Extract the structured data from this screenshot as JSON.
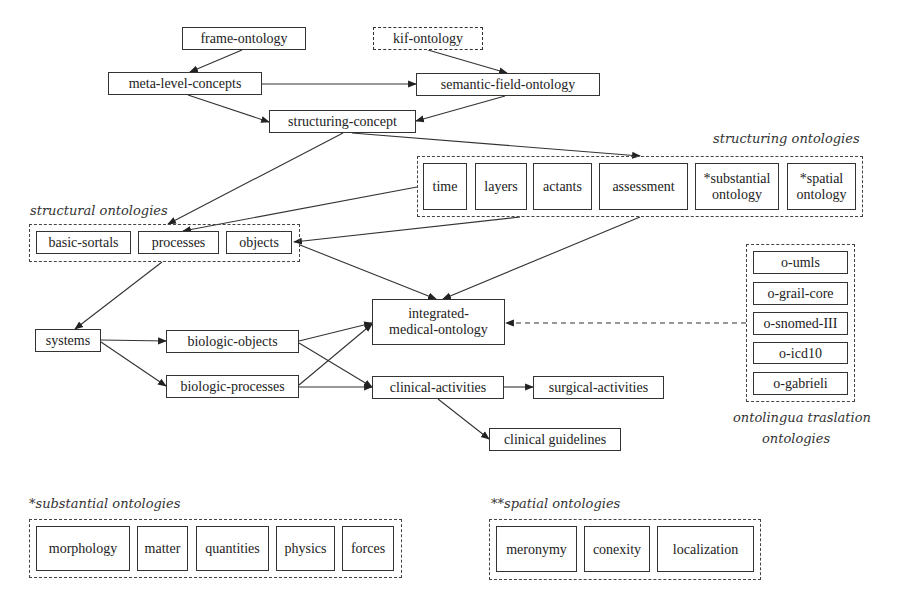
{
  "diagram": {
    "nodes": {
      "frame_ontology": "frame-ontology",
      "kif_ontology": "kif-ontology",
      "meta_level_concepts": "meta-level-concepts",
      "semantic_field_ontology": "semantic-field-ontology",
      "structuring_concept": "structuring-concept",
      "integrated_medical_ontology": "integrated-medical-ontology",
      "systems": "systems",
      "biologic_objects": "biologic-objects",
      "biologic_processes": "biologic-processes",
      "clinical_activities": "clinical-activities",
      "surgical_activities": "surgical-activities",
      "clinical_guidelines": "clinical guidelines"
    },
    "integrated_lines": [
      "integrated-",
      "medical-ontology"
    ],
    "groups": {
      "structuring": {
        "label": "structuring ontologies",
        "items": [
          {
            "lines": [
              "time"
            ]
          },
          {
            "lines": [
              "layers"
            ]
          },
          {
            "lines": [
              "actants"
            ]
          },
          {
            "lines": [
              "assessment"
            ]
          },
          {
            "lines": [
              "*substantial",
              "ontology"
            ]
          },
          {
            "lines": [
              "*spatial",
              "ontology"
            ]
          }
        ]
      },
      "structural": {
        "label": "structural ontologies",
        "items": [
          "basic-sortals",
          "processes",
          "objects"
        ]
      },
      "ontolingua": {
        "label_line1": "ontolingua traslation",
        "label_line2": "ontologies",
        "items": [
          "o-umls",
          "o-grail-core",
          "o-snomed-III",
          "o-icd10",
          "o-gabrieli"
        ]
      },
      "substantial": {
        "label": "*substantial ontologies",
        "items": [
          "morphology",
          "matter",
          "quantities",
          "physics",
          "forces"
        ]
      },
      "spatial": {
        "label": "**spatial ontologies",
        "items": [
          "meronymy",
          "conexity",
          "localization"
        ]
      }
    },
    "edges": [
      {
        "from": "frame-ontology",
        "to": "meta-level-concepts",
        "style": "solid"
      },
      {
        "from": "kif-ontology",
        "to": "semantic-field-ontology",
        "style": "solid"
      },
      {
        "from": "meta-level-concepts",
        "to": "semantic-field-ontology",
        "style": "solid"
      },
      {
        "from": "meta-level-concepts",
        "to": "structuring-concept",
        "style": "solid"
      },
      {
        "from": "semantic-field-ontology",
        "to": "structuring-concept",
        "style": "solid"
      },
      {
        "from": "structuring-concept",
        "to": "structuring ontologies",
        "style": "solid"
      },
      {
        "from": "structuring-concept",
        "to": "structural ontologies",
        "style": "solid"
      },
      {
        "from": "time",
        "to": "processes",
        "style": "solid"
      },
      {
        "from": "structuring ontologies",
        "to": "objects",
        "style": "solid"
      },
      {
        "from": "objects",
        "to": "integrated-medical-ontology",
        "style": "solid"
      },
      {
        "from": "structuring ontologies",
        "to": "integrated-medical-ontology",
        "style": "solid"
      },
      {
        "from": "structural ontologies",
        "to": "systems",
        "style": "solid"
      },
      {
        "from": "systems",
        "to": "biologic-objects",
        "style": "solid"
      },
      {
        "from": "systems",
        "to": "biologic-processes",
        "style": "solid"
      },
      {
        "from": "biologic-objects",
        "to": "integrated-medical-ontology",
        "style": "solid"
      },
      {
        "from": "biologic-processes",
        "to": "integrated-medical-ontology",
        "style": "solid"
      },
      {
        "from": "biologic-objects",
        "to": "clinical-activities",
        "style": "solid"
      },
      {
        "from": "biologic-processes",
        "to": "clinical-activities",
        "style": "solid"
      },
      {
        "from": "clinical-activities",
        "to": "surgical-activities",
        "style": "solid"
      },
      {
        "from": "clinical-activities",
        "to": "clinical guidelines",
        "style": "solid"
      },
      {
        "from": "ontolingua traslation ontologies",
        "to": "integrated-medical-ontology",
        "style": "dashed"
      }
    ],
    "colors": {
      "line": "#333333",
      "background": "#ffffff"
    }
  }
}
